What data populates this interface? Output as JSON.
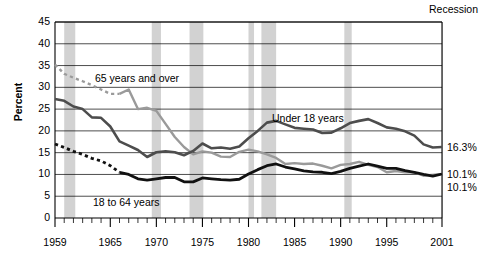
{
  "chart_data": {
    "type": "line",
    "title": "",
    "subtitle": "",
    "xlabel": "",
    "ylabel": "Percent",
    "xlim": [
      1959,
      2001
    ],
    "ylim": [
      0,
      45
    ],
    "ytick_step": 5,
    "grid": true,
    "legend_position": "inline-annotations",
    "recession_legend": "Recession",
    "ytick_labels": [
      "0",
      "5",
      "10",
      "15",
      "20",
      "25",
      "30",
      "35",
      "40",
      "45"
    ],
    "xtick_labels": [
      "1959",
      "1965",
      "1970",
      "1975",
      "1980",
      "1985",
      "1990",
      "1995",
      "2001"
    ],
    "xtick_values": [
      1959,
      1965,
      1970,
      1975,
      1980,
      1985,
      1990,
      1995,
      2001
    ],
    "x": [
      1959,
      1960,
      1961,
      1962,
      1963,
      1964,
      1965,
      1966,
      1967,
      1968,
      1969,
      1970,
      1971,
      1972,
      1973,
      1974,
      1975,
      1976,
      1977,
      1978,
      1979,
      1980,
      1981,
      1982,
      1983,
      1984,
      1985,
      1986,
      1987,
      1988,
      1989,
      1990,
      1991,
      1992,
      1993,
      1994,
      1995,
      1996,
      1997,
      1998,
      1999,
      2000,
      2001
    ],
    "series": [
      {
        "name": "65 years and over",
        "color": "#9a9a9a",
        "style": "dashed-then-solid",
        "dashed_until": 1966,
        "end_value": 10.1,
        "end_label": "10.1%",
        "values": [
          35.2,
          33.1,
          32.2,
          31.4,
          30.5,
          29.5,
          28.5,
          28.5,
          29.5,
          25.0,
          25.3,
          24.6,
          21.6,
          18.6,
          16.3,
          14.6,
          15.3,
          15.0,
          14.1,
          14.0,
          15.2,
          15.7,
          15.3,
          14.6,
          13.8,
          12.4,
          12.6,
          12.4,
          12.5,
          12.0,
          11.4,
          12.2,
          12.4,
          12.9,
          12.2,
          11.7,
          10.5,
          10.8,
          10.5,
          10.5,
          9.7,
          9.9,
          10.1
        ]
      },
      {
        "name": "Under 18 years",
        "color": "#4d4d4d",
        "style": "solid",
        "end_value": 16.3,
        "end_label": "16.3%",
        "values": [
          27.3,
          26.9,
          25.6,
          25.0,
          23.1,
          23.0,
          21.0,
          17.6,
          16.6,
          15.6,
          14.0,
          15.1,
          15.3,
          15.1,
          14.4,
          15.4,
          17.1,
          16.0,
          16.2,
          15.9,
          16.4,
          18.3,
          20.0,
          21.9,
          22.3,
          21.5,
          20.7,
          20.5,
          20.3,
          19.5,
          19.6,
          20.6,
          21.8,
          22.3,
          22.7,
          21.8,
          20.8,
          20.5,
          19.9,
          18.9,
          16.9,
          16.2,
          16.3
        ]
      },
      {
        "name": "18 to 64 years",
        "color": "#111111",
        "style": "dashed-then-solid",
        "dashed_until": 1966,
        "end_value": 10.1,
        "end_label": "10.1%",
        "values": [
          17.0,
          16.2,
          15.3,
          14.6,
          13.7,
          13.1,
          12.0,
          10.5,
          10.0,
          9.0,
          8.7,
          9.0,
          9.3,
          9.3,
          8.3,
          8.3,
          9.2,
          9.0,
          8.8,
          8.7,
          8.9,
          10.1,
          11.1,
          12.0,
          12.4,
          11.7,
          11.3,
          10.8,
          10.6,
          10.5,
          10.2,
          10.7,
          11.4,
          11.9,
          12.4,
          11.9,
          11.4,
          11.4,
          10.9,
          10.5,
          10.0,
          9.6,
          10.1
        ]
      }
    ],
    "recession_bands": [
      {
        "start": 1960.0,
        "end": 1961.2
      },
      {
        "start": 1969.5,
        "end": 1970.5
      },
      {
        "start": 1973.6,
        "end": 1975.1
      },
      {
        "start": 1980.0,
        "end": 1980.6
      },
      {
        "start": 1981.4,
        "end": 1983.0
      },
      {
        "start": 1990.4,
        "end": 1991.2
      },
      {
        "start": 2001.0,
        "end": 2001.9
      }
    ],
    "annotations": [
      {
        "text": "65 years and over",
        "x_px": 95,
        "y_px": 72
      },
      {
        "text": "Under 18 years",
        "x_px": 272,
        "y_px": 112
      },
      {
        "text": "18 to 64 years",
        "x_px": 93,
        "y_px": 196
      }
    ],
    "colors": {
      "recession_band": "#d2d2d2",
      "gridline": "#000000",
      "axis": "#000000",
      "under18": "#4d4d4d",
      "age65plus": "#9a9a9a",
      "age18to64": "#111111"
    }
  }
}
